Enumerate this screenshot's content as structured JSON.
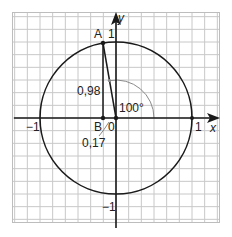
{
  "diagram": {
    "type": "unit-circle",
    "grid": {
      "cells_per_unit": 6,
      "color": "#c8c8c8",
      "border_color": "#bdbdbd"
    },
    "colors": {
      "axis": "#1a1a1a",
      "circle": "#1a1a1a",
      "arc": "#8a8a8a",
      "text": "#222222"
    },
    "axes": {
      "x_label": "x",
      "y_label": "y"
    },
    "ticks": {
      "x_pos": "1",
      "x_neg": "−1",
      "y_pos": "1",
      "y_neg": "−1",
      "origin": "0"
    },
    "points": {
      "A": {
        "label": "A",
        "x": -0.17,
        "y": 0.98
      },
      "B": {
        "label": "B",
        "x": -0.17,
        "y": 0
      }
    },
    "annotations": {
      "height_label": "0,98",
      "base_label": "0,17",
      "angle_label": "100°",
      "angle_degrees": 100
    }
  }
}
